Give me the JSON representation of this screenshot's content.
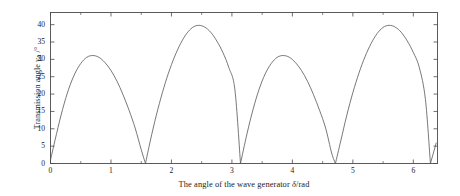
{
  "chart_data": {
    "type": "line",
    "title": "",
    "xlabel": "The angle of the wave generator δ/rad",
    "xlabel_parts": {
      "text": "The angle of the wave generator ",
      "symbol": "δ",
      "unit": "/rad"
    },
    "ylabel": "Transmission angle γA /°",
    "ylabel_parts": {
      "text": "Transmission angle ",
      "symbol": "γ",
      "subscript": "A",
      "unit": " /°"
    },
    "xlim": [
      0,
      6.4
    ],
    "ylim": [
      0,
      43.5
    ],
    "xticks": [
      0,
      1,
      2,
      3,
      4,
      5,
      6
    ],
    "xtick_labels": [
      "0",
      "1",
      "2",
      "3",
      "4",
      "5",
      "6"
    ],
    "xminor_step": 0.5,
    "yticks": [
      0,
      5,
      10,
      15,
      20,
      25,
      30,
      35,
      40
    ],
    "ytick_labels": [
      "0",
      "5",
      "10",
      "15",
      "20",
      "25",
      "30",
      "35",
      "40"
    ],
    "grid": false,
    "legend": null,
    "frame": true,
    "line_color": "#55565a",
    "line_width": 0.8,
    "series": [
      {
        "name": "Transmission angle",
        "peaks": [
          {
            "x": 0.7,
            "y": 31.1
          },
          {
            "x": 2.3,
            "y": 39.8
          },
          {
            "x": 3.85,
            "y": 31.1
          },
          {
            "x": 5.45,
            "y": 39.8
          }
        ],
        "minima": [
          {
            "x": 1.571,
            "y": 0.0
          },
          {
            "x": 3.142,
            "y": 0.0
          },
          {
            "x": 4.712,
            "y": 0.0
          },
          {
            "x": 6.283,
            "y": 0.0
          }
        ],
        "start_point": {
          "x": 0.0,
          "y": 1.0
        },
        "x": [
          0.0,
          0.1,
          0.2,
          0.3,
          0.4,
          0.5,
          0.6,
          0.7,
          0.8,
          0.9,
          1.0,
          1.1,
          1.2,
          1.3,
          1.4,
          1.5,
          1.571,
          1.65,
          1.75,
          1.85,
          1.95,
          2.05,
          2.15,
          2.25,
          2.35,
          2.45,
          2.55,
          2.65,
          2.75,
          2.85,
          2.95,
          3.05,
          3.142,
          3.25,
          3.35,
          3.45,
          3.55,
          3.65,
          3.75,
          3.85,
          3.95,
          4.05,
          4.15,
          4.25,
          4.35,
          4.45,
          4.55,
          4.65,
          4.712,
          4.8,
          4.9,
          5.0,
          5.1,
          5.2,
          5.3,
          5.4,
          5.5,
          5.6,
          5.7,
          5.8,
          5.9,
          6.0,
          6.1,
          6.2,
          6.283,
          6.38
        ],
        "y": [
          1.0,
          8.6,
          15.6,
          21.4,
          25.8,
          28.8,
          30.6,
          31.1,
          30.6,
          29.1,
          26.8,
          23.7,
          19.8,
          15.3,
          10.2,
          4.0,
          0.0,
          6.5,
          13.9,
          20.4,
          26.0,
          30.7,
          34.5,
          37.4,
          39.2,
          39.8,
          39.3,
          37.8,
          35.3,
          32.0,
          27.6,
          21.2,
          0.0,
          8.6,
          15.6,
          21.4,
          25.8,
          28.8,
          30.6,
          31.1,
          30.6,
          29.1,
          26.8,
          23.7,
          19.8,
          15.3,
          10.2,
          3.0,
          0.0,
          6.5,
          13.9,
          20.4,
          26.0,
          30.7,
          34.5,
          37.4,
          39.2,
          39.8,
          39.3,
          37.8,
          35.3,
          32.0,
          27.6,
          18.5,
          0.0,
          6.0
        ]
      }
    ]
  },
  "axes": {
    "x_tick_labels": [
      "0",
      "1",
      "2",
      "3",
      "4",
      "5",
      "6"
    ],
    "y_tick_labels": [
      "0",
      "5",
      "10",
      "15",
      "20",
      "25",
      "30",
      "35",
      "40"
    ]
  },
  "figure": {
    "background_color": "#ffffff",
    "frame_color": "#4a4a4a",
    "text_color": "#1a1a1a"
  }
}
